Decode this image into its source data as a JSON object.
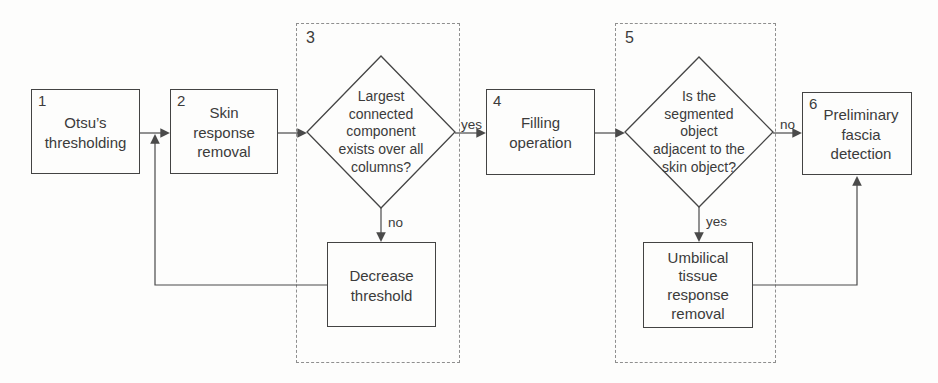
{
  "flowchart": {
    "nodes": {
      "step1": {
        "number": "1",
        "label": "Otsu’s\nthresholding"
      },
      "step2": {
        "number": "2",
        "label": "Skin\nresponse\nremoval"
      },
      "decision3": {
        "label": "Largest\nconnected\ncomponent\nexists over all\ncolumns?"
      },
      "action3": {
        "label": "Decrease\nthreshold"
      },
      "step4": {
        "number": "4",
        "label": "Filling\noperation"
      },
      "decision5": {
        "label": "Is the\nsegmented\nobject\nadjacent to the\nskin object?"
      },
      "action5": {
        "label": "Umbilical\ntissue\nresponse\nremoval"
      },
      "step6": {
        "number": "6",
        "label": "Preliminary\nfascia\ndetection"
      }
    },
    "groups": {
      "group3": {
        "number": "3"
      },
      "group5": {
        "number": "5"
      }
    },
    "edge_labels": {
      "decision3_yes": "yes",
      "decision3_no": "no",
      "decision5_no": "no",
      "decision5_yes": "yes"
    },
    "colors": {
      "line": "#4a4a4a",
      "text": "#3b3b3b",
      "background": "#fdfdfc",
      "dashed_border": "#8f8f8f"
    }
  }
}
